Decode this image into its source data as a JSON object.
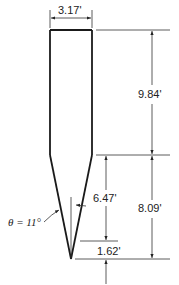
{
  "diagram": {
    "colors": {
      "stroke": "#1a1a1a",
      "dim": "#333333",
      "background": "#ffffff"
    },
    "dimensions": {
      "width": "3.17'",
      "upper_height": "9.84'",
      "lower_height": "8.09'",
      "taper_length": "6.47'",
      "tip_length": "1.62'",
      "angle": "θ = 11°"
    }
  }
}
